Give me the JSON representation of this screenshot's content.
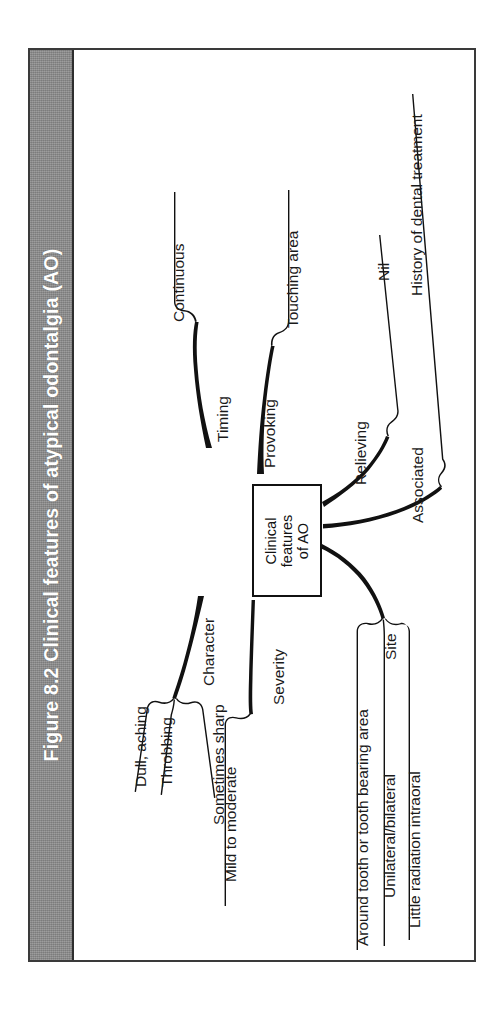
{
  "figure": {
    "caption": "Figure 8.2 Clinical features of atypical odontalgia (AO)",
    "caption_bar_color": "#8e8e8e",
    "frame_border_color": "#3a3a3a",
    "ink_color": "#111111"
  },
  "diagram": {
    "type": "mind-map",
    "center": {
      "label": "Clinical\nfeatures\nof AO",
      "line1": "Clinical",
      "line2": "features",
      "line3": "of AO"
    },
    "branches": [
      {
        "id": "timing",
        "label": "Timing",
        "leaves": [
          {
            "label": "Continuous"
          }
        ]
      },
      {
        "id": "provoking",
        "label": "Provoking",
        "leaves": [
          {
            "label": "Touching area"
          }
        ]
      },
      {
        "id": "relieving",
        "label": "Relieving",
        "leaves": [
          {
            "label": "Nil"
          }
        ]
      },
      {
        "id": "associated",
        "label": "Associated",
        "leaves": [
          {
            "label": "History of dental treatment"
          }
        ]
      },
      {
        "id": "character",
        "label": "Character",
        "leaves": [
          {
            "label": "Dull, aching"
          },
          {
            "label": "Throbbing"
          },
          {
            "label": "Sometimes sharp"
          }
        ]
      },
      {
        "id": "severity",
        "label": "Severity",
        "leaves": [
          {
            "label": "Mild to moderate"
          }
        ]
      },
      {
        "id": "site",
        "label": "Site",
        "leaves": [
          {
            "label": "Around tooth or tooth bearing area"
          },
          {
            "label": "Unilateral/bilateral"
          },
          {
            "label": "Little radiation intraoral"
          }
        ]
      }
    ]
  }
}
